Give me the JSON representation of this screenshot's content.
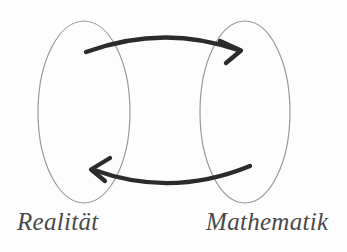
{
  "diagram": {
    "background_color": "#fdfdfd",
    "sets": [
      {
        "id": "reality",
        "label": "Realität",
        "shape": "ellipse",
        "cx": 84,
        "cy": 112,
        "rx": 46,
        "ry": 91,
        "stroke_color": "#9a9a9a",
        "stroke_width": 1.2,
        "fill": "none"
      },
      {
        "id": "mathematics",
        "label": "Mathematik",
        "shape": "ellipse",
        "cx": 245,
        "cy": 112,
        "rx": 45,
        "ry": 91,
        "stroke_color": "#9a9a9a",
        "stroke_width": 1.2,
        "fill": "none"
      }
    ],
    "arrows": [
      {
        "id": "reality-to-mathematics",
        "direction": "right",
        "from": "reality",
        "to": "mathematics",
        "start_x": 86,
        "start_y": 52,
        "end_x": 240,
        "end_y": 50,
        "control_x": 163,
        "control_y": 26,
        "stroke_color": "#2b2b2b",
        "stroke_width": 4.2
      },
      {
        "id": "mathematics-to-reality",
        "direction": "left",
        "from": "mathematics",
        "to": "reality",
        "start_x": 250,
        "start_y": 166,
        "end_x": 92,
        "end_y": 170,
        "control_x": 170,
        "control_y": 196,
        "stroke_color": "#2b2b2b",
        "stroke_width": 4.2
      }
    ],
    "label_color": "#4a4a4a"
  }
}
